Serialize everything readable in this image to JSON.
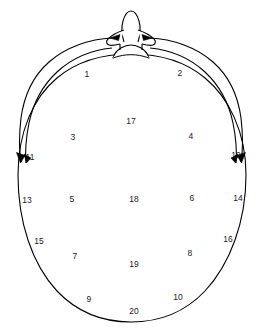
{
  "diagram": {
    "type": "anatomical-schematic",
    "view": "top-down",
    "stroke_color": "#000000",
    "background_color": "#ffffff",
    "features": {
      "nose": "nose-outline-top-center",
      "nasion_bump": "small-bump-at-top-of-head-outline",
      "left_arc_arrow": "curved-arrow-left-temporal",
      "right_arc_arrow": "curved-arrow-right-temporal",
      "outer_arcs": 2,
      "arrowheads": 4
    },
    "regions": [
      {
        "id": "1",
        "label": "1",
        "x": 87,
        "y": 74
      },
      {
        "id": "2",
        "label": "2",
        "x": 180,
        "y": 73
      },
      {
        "id": "3",
        "label": "3",
        "x": 73,
        "y": 137
      },
      {
        "id": "4",
        "label": "4",
        "x": 191,
        "y": 136
      },
      {
        "id": "5",
        "label": "5",
        "x": 72,
        "y": 199
      },
      {
        "id": "6",
        "label": "6",
        "x": 192,
        "y": 198
      },
      {
        "id": "7",
        "label": "7",
        "x": 75,
        "y": 256
      },
      {
        "id": "8",
        "label": "8",
        "x": 190,
        "y": 253
      },
      {
        "id": "9",
        "label": "9",
        "x": 89,
        "y": 299
      },
      {
        "id": "10",
        "label": "10",
        "x": 178,
        "y": 297
      },
      {
        "id": "11",
        "label": "11",
        "x": 30,
        "y": 157
      },
      {
        "id": "12",
        "label": "12",
        "x": 236,
        "y": 155
      },
      {
        "id": "13",
        "label": "13",
        "x": 27,
        "y": 200
      },
      {
        "id": "14",
        "label": "14",
        "x": 238,
        "y": 198
      },
      {
        "id": "15",
        "label": "15",
        "x": 39,
        "y": 241
      },
      {
        "id": "16",
        "label": "16",
        "x": 228,
        "y": 239
      },
      {
        "id": "17",
        "label": "17",
        "x": 131,
        "y": 121
      },
      {
        "id": "18",
        "label": "18",
        "x": 134,
        "y": 199
      },
      {
        "id": "19",
        "label": "19",
        "x": 134,
        "y": 264
      },
      {
        "id": "20",
        "label": "20",
        "x": 134,
        "y": 311
      }
    ]
  }
}
